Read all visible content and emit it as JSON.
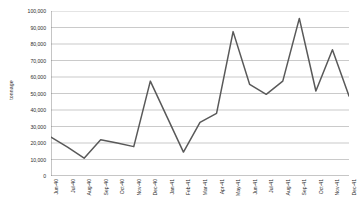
{
  "chart_data": {
    "type": "line",
    "title": "",
    "subtitle": "",
    "xlabel": "",
    "ylabel": "tonnage",
    "ylim": [
      0,
      100000
    ],
    "ytick_labels": [
      "100,000",
      "90,000",
      "80,000",
      "70,000",
      "60,000",
      "50,000",
      "40,000",
      "30,000",
      "20,000",
      "10,000",
      "0"
    ],
    "ytick_values": [
      100000,
      90000,
      80000,
      70000,
      60000,
      50000,
      40000,
      30000,
      20000,
      10000,
      0
    ],
    "grid": true,
    "grid_axis": "y",
    "legend": false,
    "legend_position": "none",
    "line_color": "#595959",
    "categories": [
      "Jun-40",
      "Jul-40",
      "Aug-40",
      "Sep-40",
      "Oct-40",
      "Nov-40",
      "Dec-40",
      "Jan-41",
      "Feb-41",
      "Mar-41",
      "Apr-41",
      "May-41",
      "Jun-41",
      "Jul-41",
      "Aug-41",
      "Sep-41",
      "Oct-41",
      "Nov-41",
      "Dec-41"
    ],
    "values": [
      23500,
      17500,
      10800,
      22000,
      20000,
      17800,
      57500,
      36000,
      14500,
      32500,
      38000,
      87500,
      55500,
      49500,
      57500,
      95500,
      51500,
      76500,
      48500
    ],
    "series": [
      {
        "name": "tonnage",
        "values": [
          23500,
          17500,
          10800,
          22000,
          20000,
          17800,
          57500,
          36000,
          14500,
          32500,
          38000,
          87500,
          55500,
          49500,
          57500,
          95500,
          51500,
          76500,
          48500
        ]
      }
    ],
    "annotations": []
  }
}
